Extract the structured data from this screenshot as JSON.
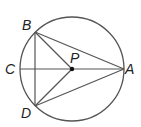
{
  "diagram": {
    "type": "circle-geometry",
    "circle": {
      "center": "P",
      "cx": 72,
      "cy": 69,
      "r": 52
    },
    "points": [
      {
        "id": "B",
        "label": "B",
        "x": 35,
        "y": 32
      },
      {
        "id": "C",
        "label": "C",
        "x": 20,
        "y": 69
      },
      {
        "id": "P",
        "label": "P",
        "x": 72,
        "y": 69
      },
      {
        "id": "A",
        "label": "A",
        "x": 124,
        "y": 69
      },
      {
        "id": "D",
        "label": "D",
        "x": 35,
        "y": 106
      }
    ],
    "segments": [
      "BA",
      "BP",
      "BD",
      "CA",
      "DP",
      "DA"
    ],
    "labels": {
      "B": "B",
      "C": "C",
      "P": "P",
      "A": "A",
      "D": "D"
    },
    "colors": {
      "stroke": "#555555",
      "text": "#222222",
      "point": "#111111"
    }
  }
}
